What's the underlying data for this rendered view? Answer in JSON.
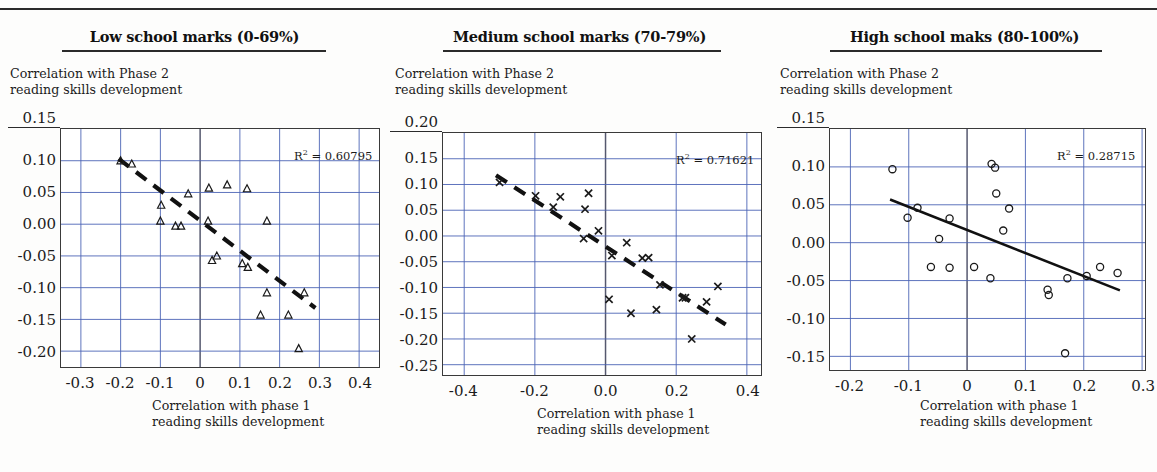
{
  "figure": {
    "axis_label_y": "Correlation with Phase 2\nreading skills development",
    "axis_label_x": "Correlation with phase 1\nreading skills development",
    "r2_prefix": "R",
    "r2_sup": "2",
    "r2_eq": " = "
  },
  "colors": {
    "grid": "#4a63b5",
    "frame": "#3a3a3a",
    "marker": "#1a1a1a",
    "trend": "#111111",
    "text": "#1b1b1b",
    "page_bg": "#fdfdfc"
  },
  "chart_data": [
    {
      "type": "scatter",
      "title": "Low school marks (0-69%)",
      "xlabel": "Correlation with phase 1 reading skills development",
      "ylabel": "Correlation with Phase 2 reading skills development",
      "r2": "0.60795",
      "r2_label": "R² = 0.60795",
      "marker": "triangle",
      "trendline_style": "dashed",
      "grid": true,
      "xlim": [
        -0.35,
        0.45
      ],
      "ylim": [
        -0.225,
        0.15
      ],
      "xticks": [
        -0.3,
        -0.2,
        -0.1,
        0,
        0.1,
        0.2,
        0.3,
        0.4
      ],
      "xtick_labels": [
        "-0.3",
        "-0.2",
        "-0.1",
        "0",
        "0.1",
        "0.2",
        "0.3",
        "0.4"
      ],
      "yticks": [
        0.15,
        0.1,
        0.05,
        0.0,
        -0.05,
        -0.1,
        -0.15,
        -0.2
      ],
      "ytick_labels": [
        "0.15",
        "0.10",
        "0.05",
        "0.00",
        "-0.05",
        "-0.10",
        "-0.15",
        "-0.20"
      ],
      "points": [
        {
          "x": -0.2,
          "y": 0.1
        },
        {
          "x": -0.172,
          "y": 0.095
        },
        {
          "x": -0.098,
          "y": 0.03
        },
        {
          "x": -0.1,
          "y": 0.005
        },
        {
          "x": -0.062,
          "y": -0.003
        },
        {
          "x": -0.048,
          "y": -0.003
        },
        {
          "x": -0.03,
          "y": 0.048
        },
        {
          "x": 0.022,
          "y": 0.057
        },
        {
          "x": 0.02,
          "y": 0.005
        },
        {
          "x": 0.068,
          "y": 0.062
        },
        {
          "x": 0.118,
          "y": 0.056
        },
        {
          "x": 0.168,
          "y": 0.005
        },
        {
          "x": 0.03,
          "y": -0.057
        },
        {
          "x": 0.042,
          "y": -0.05
        },
        {
          "x": 0.106,
          "y": -0.062
        },
        {
          "x": 0.12,
          "y": -0.068
        },
        {
          "x": 0.168,
          "y": -0.108
        },
        {
          "x": 0.262,
          "y": -0.108
        },
        {
          "x": 0.152,
          "y": -0.143
        },
        {
          "x": 0.222,
          "y": -0.143
        },
        {
          "x": 0.248,
          "y": -0.196
        }
      ],
      "trendline": {
        "x1": -0.205,
        "y1": 0.103,
        "x2": 0.29,
        "y2": -0.132
      }
    },
    {
      "type": "scatter",
      "title": "Medium school marks (70-79%)",
      "xlabel": "Correlation with phase 1 reading skills development",
      "ylabel": "Correlation with Phase 2 reading skills development",
      "r2": "0.71621",
      "r2_label": "R² = 0.71621",
      "marker": "cross",
      "trendline_style": "dashed",
      "grid": true,
      "xlim": [
        -0.46,
        0.44
      ],
      "ylim": [
        -0.27,
        0.2
      ],
      "xticks": [
        -0.4,
        -0.2,
        0.0,
        0.2,
        0.4
      ],
      "xtick_labels": [
        "-0.4",
        "-0.2",
        "0.0",
        "0.2",
        "0.4"
      ],
      "yticks": [
        0.2,
        0.15,
        0.1,
        0.05,
        0.0,
        -0.05,
        -0.1,
        -0.15,
        -0.2,
        -0.25
      ],
      "ytick_labels": [
        "0.20",
        "0.15",
        "0.10",
        "0.05",
        "0.00",
        "-0.05",
        "-0.10",
        "-0.15",
        "-0.20",
        "-0.25"
      ],
      "points": [
        {
          "x": -0.3,
          "y": 0.104
        },
        {
          "x": -0.198,
          "y": 0.078
        },
        {
          "x": -0.148,
          "y": 0.056
        },
        {
          "x": -0.128,
          "y": 0.076
        },
        {
          "x": -0.058,
          "y": 0.052
        },
        {
          "x": -0.048,
          "y": 0.083
        },
        {
          "x": -0.062,
          "y": -0.005
        },
        {
          "x": -0.02,
          "y": 0.01
        },
        {
          "x": 0.06,
          "y": -0.013
        },
        {
          "x": 0.018,
          "y": -0.038
        },
        {
          "x": 0.104,
          "y": -0.043
        },
        {
          "x": 0.122,
          "y": -0.042
        },
        {
          "x": 0.154,
          "y": -0.095
        },
        {
          "x": 0.218,
          "y": -0.12
        },
        {
          "x": 0.226,
          "y": -0.12
        },
        {
          "x": 0.286,
          "y": -0.128
        },
        {
          "x": 0.318,
          "y": -0.098
        },
        {
          "x": 0.01,
          "y": -0.123
        },
        {
          "x": 0.072,
          "y": -0.15
        },
        {
          "x": 0.144,
          "y": -0.143
        },
        {
          "x": 0.244,
          "y": -0.2
        }
      ],
      "trendline": {
        "x1": -0.31,
        "y1": 0.118,
        "x2": 0.34,
        "y2": -0.172
      }
    },
    {
      "type": "scatter",
      "title": "High school maks (80-100%)",
      "xlabel": "Correlation with phase 1 reading skills development",
      "ylabel": "Correlation with Phase 2 reading skills development",
      "r2": "0.28715",
      "r2_label": "R² = 0.28715",
      "marker": "circle",
      "trendline_style": "solid",
      "grid": true,
      "xlim": [
        -0.235,
        0.305
      ],
      "ylim": [
        -0.168,
        0.15
      ],
      "xticks": [
        -0.2,
        -0.1,
        0,
        0.1,
        0.2,
        0.3
      ],
      "xtick_labels": [
        "-0.2",
        "-0.1",
        "0",
        "0.1",
        "0.2",
        "0.3"
      ],
      "yticks": [
        0.15,
        0.1,
        0.05,
        0.0,
        -0.05,
        -0.1,
        -0.15
      ],
      "ytick_labels": [
        "0.15",
        "0.10",
        "0.05",
        "0.00",
        "-0.05",
        "-0.10",
        "-0.15"
      ],
      "points": [
        {
          "x": -0.128,
          "y": 0.097
        },
        {
          "x": 0.042,
          "y": 0.104
        },
        {
          "x": 0.048,
          "y": 0.099
        },
        {
          "x": 0.05,
          "y": 0.065
        },
        {
          "x": -0.085,
          "y": 0.046
        },
        {
          "x": 0.072,
          "y": 0.045
        },
        {
          "x": -0.102,
          "y": 0.033
        },
        {
          "x": -0.03,
          "y": 0.032
        },
        {
          "x": 0.062,
          "y": 0.016
        },
        {
          "x": -0.048,
          "y": 0.005
        },
        {
          "x": -0.062,
          "y": -0.032
        },
        {
          "x": -0.03,
          "y": -0.033
        },
        {
          "x": 0.012,
          "y": -0.032
        },
        {
          "x": 0.228,
          "y": -0.032
        },
        {
          "x": 0.258,
          "y": -0.04
        },
        {
          "x": 0.04,
          "y": -0.047
        },
        {
          "x": 0.172,
          "y": -0.047
        },
        {
          "x": 0.205,
          "y": -0.044
        },
        {
          "x": 0.138,
          "y": -0.062
        },
        {
          "x": 0.14,
          "y": -0.069
        },
        {
          "x": 0.168,
          "y": -0.146
        }
      ],
      "trendline": {
        "x1": -0.132,
        "y1": 0.057,
        "x2": 0.262,
        "y2": -0.063
      }
    }
  ]
}
